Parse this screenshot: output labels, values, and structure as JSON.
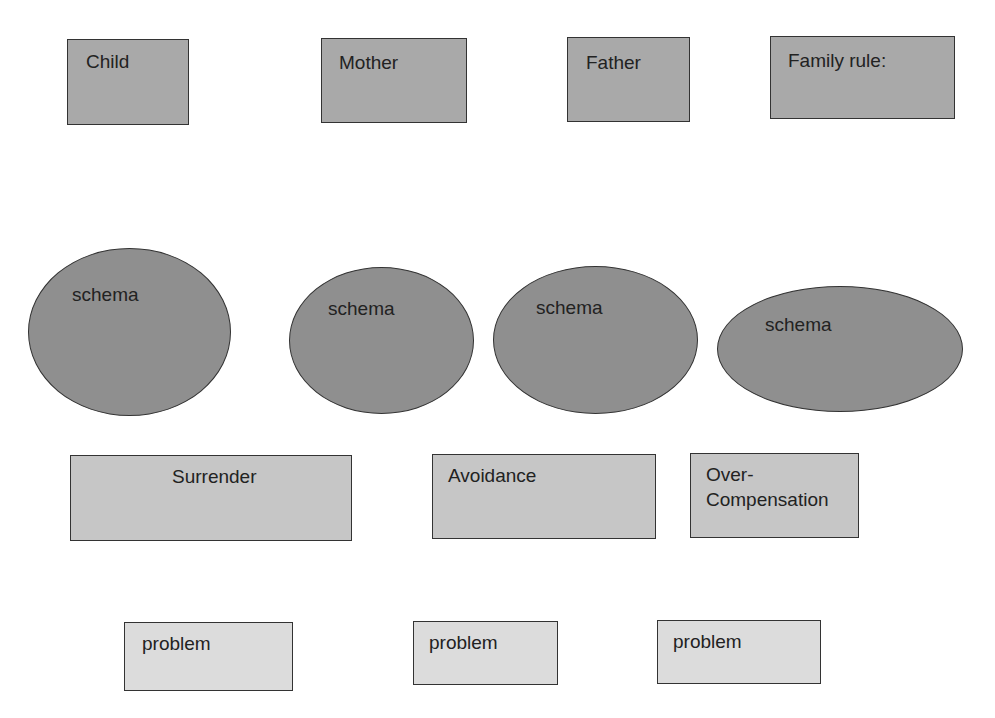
{
  "diagram": {
    "title_boxes": [
      {
        "id": "child",
        "label": "Child",
        "x": 67,
        "y": 39,
        "w": 122,
        "h": 86,
        "label_x": 18,
        "label_y": 10
      },
      {
        "id": "mother",
        "label": "Mother",
        "x": 321,
        "y": 38,
        "w": 146,
        "h": 85,
        "label_x": 17,
        "label_y": 12
      },
      {
        "id": "father",
        "label": "Father",
        "x": 567,
        "y": 37,
        "w": 123,
        "h": 85,
        "label_x": 18,
        "label_y": 13
      },
      {
        "id": "family-rule",
        "label": "Family rule:",
        "x": 770,
        "y": 36,
        "w": 185,
        "h": 83,
        "label_x": 17,
        "label_y": 12
      }
    ],
    "schemas": [
      {
        "id": "schema-child",
        "label": "schema",
        "x": 28,
        "y": 248,
        "w": 203,
        "h": 168,
        "label_x": 43,
        "label_y": 34
      },
      {
        "id": "schema-mother",
        "label": "schema",
        "x": 289,
        "y": 267,
        "w": 185,
        "h": 147,
        "label_x": 38,
        "label_y": 29
      },
      {
        "id": "schema-father",
        "label": "schema",
        "x": 493,
        "y": 266,
        "w": 205,
        "h": 148,
        "label_x": 42,
        "label_y": 29
      },
      {
        "id": "schema-family-rule",
        "label": "schema",
        "x": 717,
        "y": 286,
        "w": 246,
        "h": 126,
        "label_x": 47,
        "label_y": 26
      }
    ],
    "coping_styles": [
      {
        "id": "surrender",
        "label": "Surrender",
        "x": 70,
        "y": 455,
        "w": 282,
        "h": 86,
        "label_x": 101,
        "label_y": 9
      },
      {
        "id": "avoidance",
        "label": "Avoidance",
        "x": 432,
        "y": 454,
        "w": 224,
        "h": 85,
        "label_x": 15,
        "label_y": 9
      },
      {
        "id": "over-compensation",
        "label": "Over-\nCompensation",
        "line1": "Over-",
        "line2": "Compensation",
        "x": 690,
        "y": 453,
        "w": 169,
        "h": 85,
        "label_x": 15,
        "label_y": 9
      }
    ],
    "problems": [
      {
        "id": "problem-1",
        "label": "problem",
        "x": 124,
        "y": 622,
        "w": 169,
        "h": 69,
        "label_x": 17,
        "label_y": 9
      },
      {
        "id": "problem-2",
        "label": "problem",
        "x": 413,
        "y": 621,
        "w": 145,
        "h": 64,
        "label_x": 15,
        "label_y": 9
      },
      {
        "id": "problem-3",
        "label": "problem",
        "x": 657,
        "y": 620,
        "w": 164,
        "h": 64,
        "label_x": 15,
        "label_y": 9
      }
    ],
    "colors": {
      "title_box_fill": "#a9a9a9",
      "schema_fill": "#8f8f8f",
      "coping_fill": "#c6c6c6",
      "problem_fill": "#dcdcdc",
      "stroke": "#333333",
      "text": "#222222",
      "background": "#ffffff"
    }
  }
}
